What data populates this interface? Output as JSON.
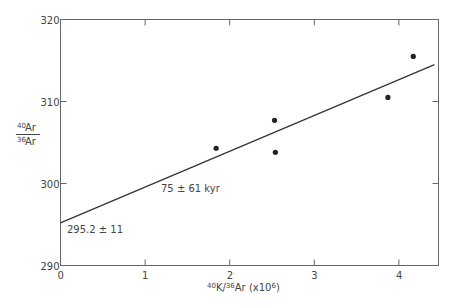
{
  "chart_data": {
    "type": "scatter",
    "title": "",
    "xlabel": "40K/36Ar (x10^6)",
    "ylabel": "40Ar/36Ar",
    "xlim": [
      0,
      4.47
    ],
    "ylim": [
      290,
      320
    ],
    "x_ticks": [
      "0",
      "1",
      "2",
      "3",
      "4"
    ],
    "y_ticks": [
      "290",
      "300",
      "310",
      "320"
    ],
    "grid": false,
    "legend": null,
    "series": [
      {
        "name": "samples",
        "points": [
          {
            "x": 1.84,
            "y": 304.3
          },
          {
            "x": 2.53,
            "y": 307.7
          },
          {
            "x": 2.54,
            "y": 303.8
          },
          {
            "x": 3.87,
            "y": 310.5
          },
          {
            "x": 4.17,
            "y": 315.5
          }
        ]
      },
      {
        "name": "isochron fit",
        "type": "line",
        "points": [
          {
            "x": 0,
            "y": 295.2
          },
          {
            "x": 4.42,
            "y": 314.5
          }
        ]
      }
    ],
    "annotations": [
      {
        "text": "75 ± 61 kyr",
        "x": 1.2,
        "y": 299.5
      },
      {
        "text": "295.2 ± 11",
        "x": 0.07,
        "y": 293.6
      }
    ]
  },
  "labels": {
    "age": "75 ± 61 kyr",
    "intercept": "295.2 ± 11",
    "y_num_sup": "40",
    "y_num": "Ar",
    "y_den_sup": "36",
    "y_den": "Ar",
    "x_sup1": "40",
    "x_k": "K/",
    "x_sup2": "36",
    "x_ar": "Ar (x10",
    "x_exp": "6",
    "x_close": ")"
  }
}
